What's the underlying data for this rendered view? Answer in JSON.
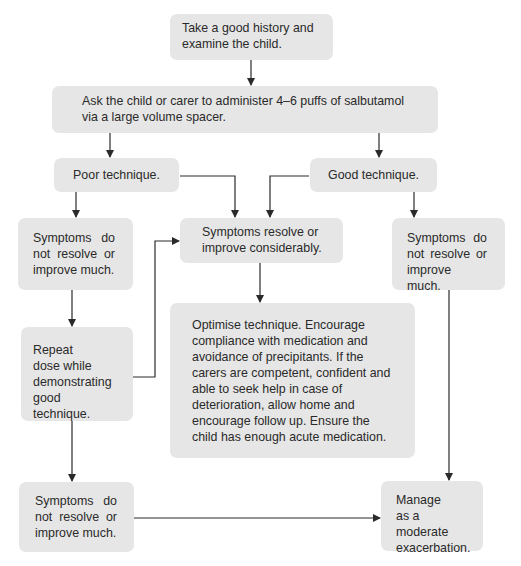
{
  "diagram": {
    "type": "flowchart",
    "colors": {
      "box_fill": "#e6e6e6",
      "line": "#2a2a2a",
      "text": "#2a2a2a"
    },
    "nodes": {
      "history": {
        "text": "Take a good history and examine the child."
      },
      "administer": {
        "text": "Ask the child or carer to administer 4–6 puffs of salbutamol via a large volume spacer."
      },
      "poor_technique": {
        "text": "Poor technique."
      },
      "good_technique": {
        "text": "Good technique."
      },
      "no_improve_left": {
        "text": "Symptoms do not resolve or improve much."
      },
      "resolve": {
        "text": "Symptoms resolve or improve considerably."
      },
      "no_improve_right": {
        "text": "Symptoms do not resolve or improve much."
      },
      "optimise": {
        "text": "Optimise technique. Encourage compliance with medication and avoidance of precipitants. If the carers are competent, confident and able to seek help in case of deterioration, allow home and encourage follow up. Ensure the child has enough acute medication."
      },
      "repeat_dose": {
        "text": "Repeat dose while demonstrating good technique."
      },
      "no_improve_bottom": {
        "text": "Symptoms do not resolve or improve much."
      },
      "moderate": {
        "text": "Manage as a moderate exacerbation."
      }
    },
    "edges": [
      {
        "from": "history",
        "to": "administer"
      },
      {
        "from": "administer",
        "to": "poor_technique"
      },
      {
        "from": "administer",
        "to": "good_technique"
      },
      {
        "from": "poor_technique",
        "to": "no_improve_left"
      },
      {
        "from": "poor_technique",
        "to": "resolve"
      },
      {
        "from": "good_technique",
        "to": "resolve"
      },
      {
        "from": "good_technique",
        "to": "no_improve_right"
      },
      {
        "from": "resolve",
        "to": "optimise"
      },
      {
        "from": "no_improve_left",
        "to": "repeat_dose"
      },
      {
        "from": "repeat_dose",
        "to": "resolve"
      },
      {
        "from": "repeat_dose",
        "to": "no_improve_bottom"
      },
      {
        "from": "no_improve_right",
        "to": "moderate"
      },
      {
        "from": "no_improve_bottom",
        "to": "moderate"
      }
    ]
  }
}
